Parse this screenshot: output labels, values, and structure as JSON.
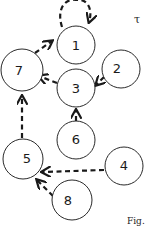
{
  "diagram": {
    "type": "directed-graph",
    "style": "hand-drawn circles with dashed arrows",
    "corner_symbol": "τ",
    "caption_fragment": "Fig.",
    "stroke_color": "#1a1a1a",
    "background": "#ffffff",
    "nodes": [
      {
        "id": "1",
        "label": "1",
        "cx": 76,
        "cy": 45,
        "r": 19
      },
      {
        "id": "2",
        "label": "2",
        "cx": 121,
        "cy": 69,
        "r": 19
      },
      {
        "id": "3",
        "label": "3",
        "cx": 76,
        "cy": 88,
        "r": 19
      },
      {
        "id": "4",
        "label": "4",
        "cx": 124,
        "cy": 166,
        "r": 19
      },
      {
        "id": "5",
        "label": "5",
        "cx": 23,
        "cy": 159,
        "r": 20
      },
      {
        "id": "6",
        "label": "6",
        "cx": 76,
        "cy": 140,
        "r": 19
      },
      {
        "id": "7",
        "label": "7",
        "cx": 22,
        "cy": 70,
        "r": 21
      },
      {
        "id": "8",
        "label": "8",
        "cx": 72,
        "cy": 200,
        "r": 20
      }
    ],
    "edges": [
      {
        "from": "1",
        "to": "1",
        "kind": "self-loop",
        "dashed": true
      },
      {
        "from": "7",
        "to": "1",
        "dashed": true
      },
      {
        "from": "3",
        "to": "7",
        "dashed": true
      },
      {
        "from": "2",
        "to": "3",
        "dashed": true
      },
      {
        "from": "6",
        "to": "3",
        "dashed": true
      },
      {
        "from": "5",
        "to": "7",
        "dashed": true
      },
      {
        "from": "4",
        "to": "5",
        "dashed": true
      },
      {
        "from": "8",
        "to": "5",
        "dashed": true
      }
    ]
  }
}
